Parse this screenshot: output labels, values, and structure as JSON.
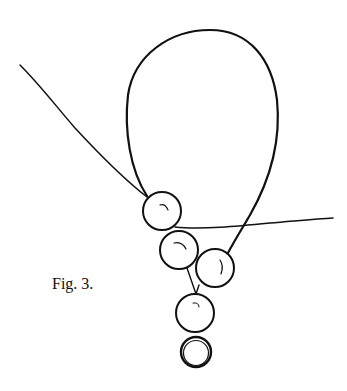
{
  "figure": {
    "caption": "Fig. 3.",
    "ink_color": "#111111",
    "background": "#ffffff",
    "elements": {
      "loop": "thread-loop",
      "left_thread": "thread-end-left",
      "right_thread": "thread-end-right",
      "beads": [
        "bead-1",
        "bead-2",
        "bead-3",
        "bead-4"
      ],
      "ring": "ring"
    }
  }
}
